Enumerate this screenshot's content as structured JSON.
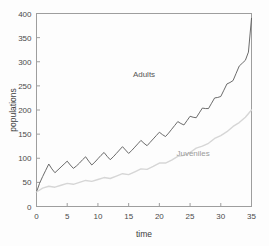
{
  "chart_data": {
    "type": "line",
    "title": "",
    "xlabel": "time",
    "ylabel": "populations",
    "xlim": [
      0,
      35
    ],
    "ylim": [
      0,
      400
    ],
    "xticks": [
      0,
      5,
      10,
      15,
      20,
      25,
      30,
      35
    ],
    "yticks": [
      0,
      50,
      100,
      150,
      200,
      250,
      300,
      350,
      400
    ],
    "grid": false,
    "legend_position": "inline-annotations",
    "annotations": [
      {
        "text": "Adults",
        "x": 17.5,
        "y": 268
      },
      {
        "text": "Juveniles",
        "x": 25.5,
        "y": 104
      }
    ],
    "series": [
      {
        "name": "Adults",
        "color": "#5a5a5a",
        "width": 0.9,
        "x": [
          0,
          0.5,
          1,
          1.5,
          2,
          2.5,
          3,
          3.5,
          4,
          4.5,
          5,
          5.5,
          6,
          6.5,
          7,
          7.5,
          8,
          8.5,
          9,
          9.5,
          10,
          10.5,
          11,
          11.5,
          12,
          12.5,
          13,
          13.5,
          14,
          14.5,
          15,
          15.5,
          16,
          16.5,
          17,
          17.5,
          18,
          18.5,
          19,
          19.5,
          20,
          20.5,
          21,
          21.5,
          22,
          22.5,
          23,
          23.5,
          24,
          24.5,
          25,
          25.5,
          26,
          26.5,
          27,
          27.5,
          28,
          28.5,
          29,
          29.5,
          30,
          30.5,
          31,
          31.5,
          32,
          32.5,
          33,
          33.5,
          34,
          34.5,
          35
        ],
        "y": [
          30,
          48,
          62,
          75,
          88,
          78,
          70,
          76,
          82,
          88,
          94,
          86,
          79,
          84,
          90,
          97,
          103,
          94,
          86,
          92,
          99,
          106,
          112,
          104,
          97,
          103,
          110,
          117,
          124,
          117,
          110,
          116,
          123,
          130,
          137,
          131,
          126,
          133,
          140,
          147,
          154,
          149,
          145,
          152,
          160,
          168,
          176,
          172,
          169,
          178,
          187,
          185,
          184,
          194,
          204,
          203,
          203,
          214,
          225,
          226,
          228,
          241,
          254,
          257,
          261,
          276,
          291,
          297,
          303,
          320,
          338
        ],
        "y_endpoint": 390
      },
      {
        "name": "Juveniles",
        "color": "#d6d6d6",
        "width": 1.4,
        "x": [
          0,
          1,
          2,
          3,
          4,
          5,
          6,
          7,
          8,
          9,
          10,
          11,
          12,
          13,
          14,
          15,
          16,
          17,
          18,
          19,
          20,
          21,
          22,
          23,
          24,
          25,
          26,
          27,
          28,
          29,
          30,
          31,
          32,
          33,
          34,
          35
        ],
        "y": [
          30,
          38,
          42,
          40,
          44,
          48,
          46,
          50,
          54,
          52,
          56,
          60,
          58,
          63,
          68,
          66,
          72,
          78,
          77,
          83,
          90,
          90,
          96,
          104,
          106,
          112,
          121,
          125,
          131,
          141,
          147,
          155,
          166,
          174,
          185,
          200
        ]
      }
    ]
  },
  "axis": {
    "y_title": "populations",
    "x_title": "time",
    "x_tick_labels": [
      "0",
      "5",
      "10",
      "15",
      "20",
      "25",
      "30",
      "35"
    ],
    "y_tick_labels": [
      "0",
      "50",
      "100",
      "150",
      "200",
      "250",
      "300",
      "350",
      "400"
    ]
  }
}
